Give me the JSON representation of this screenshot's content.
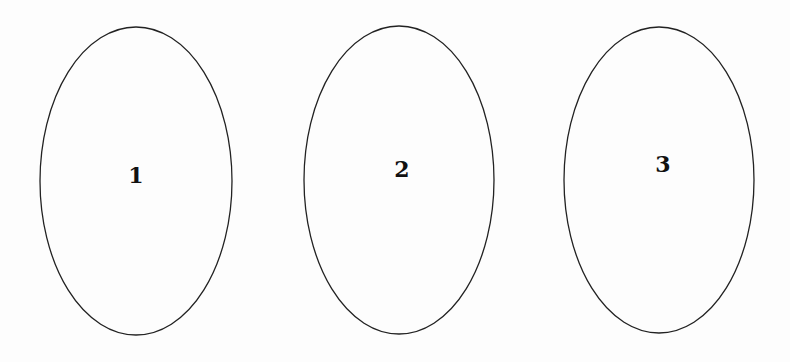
{
  "diagram": {
    "stroke_color": "#222222",
    "background": "#fdfdfd",
    "ellipses": [
      {
        "label": "1",
        "cx": 136,
        "cy": 181,
        "rx": 96,
        "ry": 154,
        "label_x": 136,
        "label_y": 183
      },
      {
        "label": "2",
        "cx": 399,
        "cy": 180,
        "rx": 95,
        "ry": 154,
        "label_x": 402,
        "label_y": 177
      },
      {
        "label": "3",
        "cx": 659,
        "cy": 180,
        "rx": 95,
        "ry": 153,
        "label_x": 663,
        "label_y": 172
      }
    ]
  }
}
